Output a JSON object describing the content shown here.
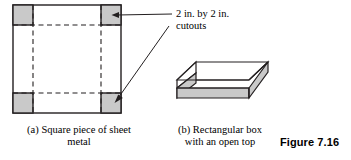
{
  "figure": {
    "label": "Figure 7.16",
    "annotation": {
      "line1": "2 in. by 2 in.",
      "line2": "cutouts"
    },
    "caption_a": "(a) Square piece of sheet metal",
    "caption_b": "(b) Rectangular box with an open top"
  },
  "colors": {
    "fill_gray": "#c9c9c9",
    "stroke": "#231f20",
    "background": "#ffffff"
  },
  "sheet_metal": {
    "square": {
      "x": 13,
      "y": 5,
      "size": 108
    },
    "cutout_size": 20,
    "cutouts": [
      {
        "name": "top-left",
        "x": 13,
        "y": 5
      },
      {
        "name": "top-right",
        "x": 101,
        "y": 5
      },
      {
        "name": "bottom-left",
        "x": 13,
        "y": 93
      },
      {
        "name": "bottom-right",
        "x": 101,
        "y": 93
      }
    ]
  },
  "leaders": [
    {
      "name": "cutout-arrow-top",
      "x1": 172,
      "y1": 14,
      "x2": 114,
      "y2": 15
    },
    {
      "name": "cutout-arrow-bottom",
      "x1": 169,
      "y1": 26,
      "x2": 115,
      "y2": 100
    }
  ]
}
